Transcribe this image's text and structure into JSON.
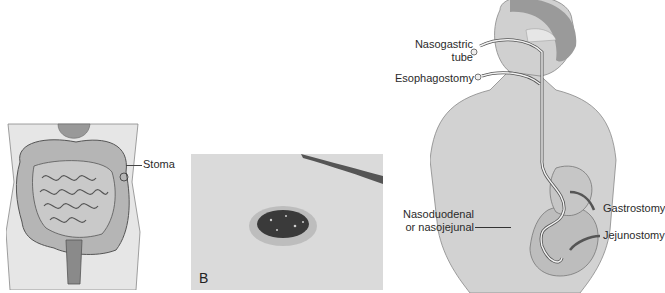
{
  "figure": {
    "panel_a": {
      "description": "Abdominal illustration of intestines with stoma",
      "labels": {
        "stoma": "Stoma"
      }
    },
    "panel_b": {
      "description": "Photograph of stoma on skin",
      "panel_letter": "B"
    },
    "panel_c": {
      "description": "Human torso illustration showing feeding tube placements",
      "labels": {
        "nasogastric": "Nasogastric",
        "nasogastric_line2": "tube",
        "esophagostomy": "Esophagostomy",
        "nasoduodenal": "Nasoduodenal",
        "nasoduodenal_line2": "or nasojejunal",
        "gastrostomy": "Gastrostomy",
        "jejunostomy": "Jejunostomy"
      }
    }
  }
}
